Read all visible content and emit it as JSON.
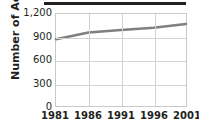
{
  "chart_data": {
    "type": "line",
    "title": "",
    "xlabel": "",
    "ylabel": "Number of Acres",
    "x": [
      1981,
      1986,
      1991,
      1996,
      2001
    ],
    "categories": [
      "1981",
      "1986",
      "1991",
      "1996",
      "2001"
    ],
    "values": [
      870,
      960,
      990,
      1020,
      1070
    ],
    "series": [
      {
        "name": "Number of Acres",
        "values": [
          870,
          960,
          990,
          1020,
          1070
        ],
        "color": "#7f7f7f"
      }
    ],
    "ylim": [
      0,
      1200
    ],
    "yticks": [
      0,
      300,
      600,
      900,
      1200
    ],
    "ytick_labels": [
      "0",
      "300",
      "600",
      "900",
      "1,200"
    ],
    "xticks": [
      1981,
      1986,
      1991,
      1996,
      2001
    ],
    "xtick_labels": [
      "1981",
      "1986",
      "1991",
      "1996",
      "2001"
    ],
    "grid": true,
    "grid_axis": "both",
    "legend": false,
    "legend_position": "none"
  },
  "style": {
    "line_color": "#7f7f7f",
    "grid_color": "#d2d2d2",
    "axis_border_color": "#c9c9c9",
    "text_color": "#231f20",
    "rule_color": "#231f20",
    "background": "#ffffff"
  },
  "decoration": {
    "top_rule_present": true
  }
}
